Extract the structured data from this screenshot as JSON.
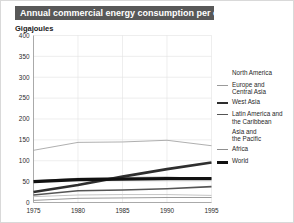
{
  "figure": {
    "title": "Annual commercial energy consumption per capita",
    "unit_label": "Gigajoules",
    "title_bg": "#585858",
    "title_color": "#ffffff"
  },
  "legend": {
    "position": "right",
    "items": [
      {
        "label": "North America",
        "color": "#9a9a9a",
        "width": 0.8,
        "swatch": false
      },
      {
        "label": "Europe and\nCentral Asia",
        "color": "#9a9a9a",
        "width": 0.9,
        "swatch": true
      },
      {
        "label": "West Asia",
        "color": "#2e2e2e",
        "width": 2.6,
        "swatch": true
      },
      {
        "label": "Latin America and\nthe Caribbean",
        "color": "#555555",
        "width": 1.6,
        "swatch": true
      },
      {
        "label": "Asia and\nthe Pacific",
        "color": "#bdbdbd",
        "width": 0.9,
        "swatch": false
      },
      {
        "label": "Africa",
        "color": "#8f8f8f",
        "width": 0.9,
        "swatch": true
      },
      {
        "label": "World",
        "color": "#111111",
        "width": 3.2,
        "swatch": true
      }
    ]
  },
  "chart_data": {
    "type": "line",
    "title": "Annual commercial energy consumption per capita",
    "xlabel": "",
    "ylabel": "Gigajoules",
    "x": [
      1975,
      1980,
      1985,
      1990,
      1995
    ],
    "xticks": [
      "1975",
      "1980",
      "1985",
      "1990",
      "1995"
    ],
    "yticks": [
      0,
      50,
      100,
      150,
      200,
      250,
      300,
      350,
      400
    ],
    "ylim": [
      0,
      400
    ],
    "xlim": [
      1975,
      1995
    ],
    "grid": true,
    "legend_position": "right",
    "series": [
      {
        "name": "North America",
        "values": [
          125,
          144,
          145,
          149,
          136
        ],
        "color": "#9a9a9a",
        "width": 0.8
      },
      {
        "name": "Europe and Central Asia",
        "values": [
          52,
          58,
          60,
          61,
          57
        ],
        "color": "#9a9a9a",
        "width": 0.9
      },
      {
        "name": "West Asia",
        "values": [
          25,
          42,
          62,
          80,
          96
        ],
        "color": "#2e2e2e",
        "width": 2.6
      },
      {
        "name": "Latin America and the Caribbean",
        "values": [
          18,
          28,
          30,
          33,
          38
        ],
        "color": "#555555",
        "width": 1.6
      },
      {
        "name": "Asia and the Pacific",
        "values": [
          14,
          18,
          19,
          19,
          17
        ],
        "color": "#bdbdbd",
        "width": 0.9
      },
      {
        "name": "Africa",
        "values": [
          5,
          10,
          11,
          12,
          12
        ],
        "color": "#8f8f8f",
        "width": 0.9
      },
      {
        "name": "World",
        "values": [
          50,
          55,
          56,
          57,
          57
        ],
        "color": "#111111",
        "width": 3.2
      }
    ]
  }
}
